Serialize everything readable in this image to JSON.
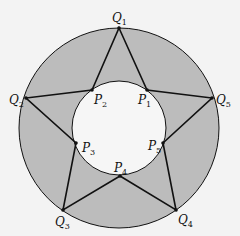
{
  "diagram": {
    "colors": {
      "background": "#f3f3f3",
      "annulus_fill": "#bcbcbc",
      "inner_fill": "#f6f6f6",
      "line": "#111111"
    },
    "outer_circle": {
      "cx": 119,
      "cy": 128,
      "r": 100
    },
    "inner_circle": {
      "cx": 119,
      "cy": 128,
      "r": 47
    },
    "star_path_order": [
      "Q1",
      "P1",
      "Q5",
      "P5",
      "Q4",
      "P4",
      "Q3",
      "P3",
      "Q2",
      "P2"
    ],
    "points": {
      "Q1": {
        "x": 119,
        "y": 28,
        "label": "Q",
        "sub": "1",
        "lx": 112,
        "ly": 22
      },
      "Q2": {
        "x": 26,
        "y": 98,
        "label": "Q",
        "sub": "2",
        "lx": 9,
        "ly": 104
      },
      "Q3": {
        "x": 63,
        "y": 210,
        "label": "Q",
        "sub": "3",
        "lx": 55,
        "ly": 226
      },
      "Q4": {
        "x": 176,
        "y": 210,
        "label": "Q",
        "sub": "4",
        "lx": 178,
        "ly": 224
      },
      "Q5": {
        "x": 212,
        "y": 98,
        "label": "Q",
        "sub": "5",
        "lx": 216,
        "ly": 104
      },
      "P1": {
        "x": 147,
        "y": 90,
        "label": "P",
        "sub": "1",
        "lx": 138,
        "ly": 104
      },
      "P2": {
        "x": 92,
        "y": 90,
        "label": "P",
        "sub": "2",
        "lx": 94,
        "ly": 104
      },
      "P3": {
        "x": 76,
        "y": 143,
        "label": "P",
        "sub": "3",
        "lx": 82,
        "ly": 152
      },
      "P4": {
        "x": 120,
        "y": 176,
        "label": "P",
        "sub": "4",
        "lx": 114,
        "ly": 172
      },
      "P5": {
        "x": 163,
        "y": 143,
        "label": "P",
        "sub": "5",
        "lx": 148,
        "ly": 150
      }
    }
  }
}
